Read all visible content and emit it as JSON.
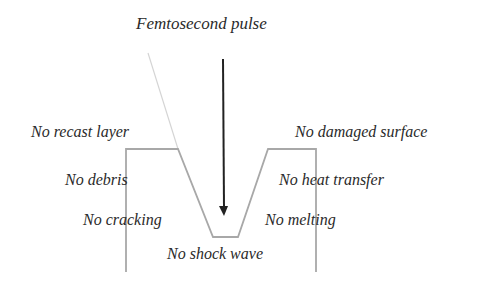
{
  "diagram": {
    "title": "Femtosecond pulse",
    "labels": {
      "recast": "No recast layer",
      "damaged": "No damaged surface",
      "debris": "No debris",
      "heat": "No heat transfer",
      "cracking": "No cracking",
      "melting": "No melting",
      "shock": "No shock wave"
    },
    "colors": {
      "arrow": "#222222",
      "outline": "#a8a8a8",
      "beam": "#d0d0d0",
      "text": "#2a2a2a"
    }
  }
}
